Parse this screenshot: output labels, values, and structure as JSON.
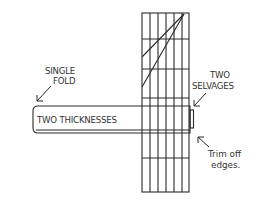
{
  "diagram": {
    "labels": {
      "single_fold": [
        "SINGLE",
        "FOLD"
      ],
      "two_selvages": [
        "TWO",
        "SELVAGES"
      ],
      "two_thicknesses": "TWO THICKNESSES",
      "trim_off_edges": [
        "Trim off",
        "edges."
      ]
    },
    "grid": {
      "x_left": 142,
      "x_right": 189,
      "y_top": 13,
      "y_bottom": 192,
      "vertical_lines_x": [
        142,
        150,
        158,
        166,
        174,
        182,
        189
      ],
      "horizontal_lines_y": [
        13,
        39,
        69,
        98,
        106,
        133,
        158,
        192
      ]
    },
    "diagonals": [
      {
        "from": [
          142,
          57
        ],
        "to": [
          184,
          14
        ]
      },
      {
        "from": [
          142,
          87
        ],
        "to": [
          184,
          14
        ]
      }
    ],
    "band": {
      "x_left": 33,
      "x_right": 192,
      "y_top": 106,
      "y_bottom": 133,
      "radius": 4
    },
    "colors": {
      "ink": "#2a2a2a",
      "background": "#ffffff"
    }
  }
}
